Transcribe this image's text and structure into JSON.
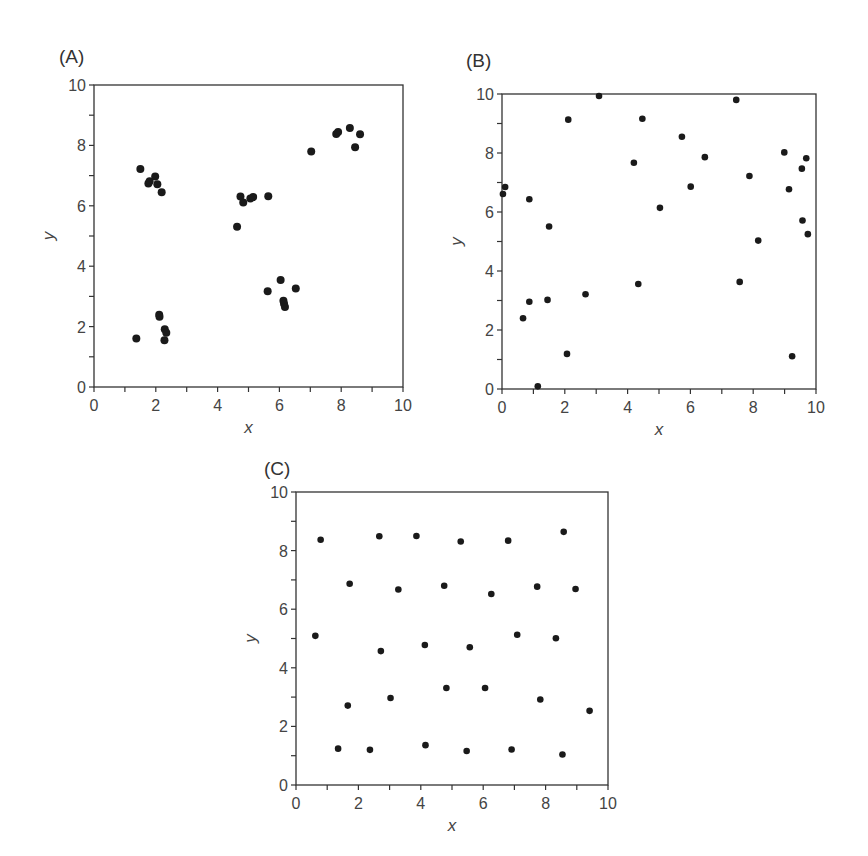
{
  "chart_data": [
    {
      "id": "A",
      "panel_label": "(A)",
      "type": "scatter",
      "title": "",
      "xlabel": "x",
      "ylabel": "y",
      "xlim": [
        0,
        10
      ],
      "ylim": [
        0,
        10
      ],
      "x_ticks": [
        0,
        2,
        4,
        6,
        8,
        10
      ],
      "y_ticks": [
        0,
        2,
        4,
        6,
        8,
        10
      ],
      "grid": false,
      "marker_color": "#1a1a1a",
      "points": [
        [
          1.5,
          7.22
        ],
        [
          1.76,
          6.74
        ],
        [
          1.8,
          6.81
        ],
        [
          1.98,
          6.97
        ],
        [
          2.05,
          6.71
        ],
        [
          2.19,
          6.45
        ],
        [
          1.37,
          1.61
        ],
        [
          2.11,
          2.39
        ],
        [
          2.12,
          2.33
        ],
        [
          2.29,
          1.91
        ],
        [
          2.34,
          1.8
        ],
        [
          2.28,
          1.55
        ],
        [
          4.63,
          5.31
        ],
        [
          4.74,
          6.31
        ],
        [
          4.83,
          6.11
        ],
        [
          5.06,
          6.24
        ],
        [
          5.15,
          6.29
        ],
        [
          5.64,
          6.32
        ],
        [
          5.62,
          3.17
        ],
        [
          6.04,
          3.54
        ],
        [
          6.53,
          3.26
        ],
        [
          6.13,
          2.86
        ],
        [
          6.15,
          2.76
        ],
        [
          6.18,
          2.65
        ],
        [
          7.03,
          7.8
        ],
        [
          7.84,
          8.38
        ],
        [
          7.9,
          8.44
        ],
        [
          8.28,
          8.58
        ],
        [
          8.61,
          8.37
        ],
        [
          8.45,
          7.94
        ]
      ]
    },
    {
      "id": "B",
      "panel_label": "(B)",
      "type": "scatter",
      "title": "",
      "xlabel": "x",
      "ylabel": "y",
      "xlim": [
        0,
        10
      ],
      "ylim": [
        0,
        10
      ],
      "x_ticks": [
        0,
        2,
        4,
        6,
        8,
        10
      ],
      "y_ticks": [
        0,
        2,
        4,
        6,
        8,
        10
      ],
      "grid": false,
      "marker_color": "#1a1a1a",
      "points": [
        [
          0.03,
          6.61
        ],
        [
          0.1,
          6.85
        ],
        [
          0.87,
          6.43
        ],
        [
          1.5,
          5.51
        ],
        [
          2.11,
          9.13
        ],
        [
          3.09,
          9.93
        ],
        [
          4.2,
          7.67
        ],
        [
          4.47,
          9.16
        ],
        [
          5.03,
          6.14
        ],
        [
          5.73,
          8.55
        ],
        [
          6.01,
          6.86
        ],
        [
          6.46,
          7.86
        ],
        [
          7.46,
          9.8
        ],
        [
          7.88,
          7.22
        ],
        [
          8.16,
          5.03
        ],
        [
          7.57,
          3.63
        ],
        [
          8.99,
          8.02
        ],
        [
          9.14,
          6.77
        ],
        [
          9.55,
          7.47
        ],
        [
          9.69,
          7.82
        ],
        [
          9.57,
          5.71
        ],
        [
          9.74,
          5.25
        ],
        [
          9.24,
          1.11
        ],
        [
          0.67,
          2.4
        ],
        [
          0.87,
          2.96
        ],
        [
          1.45,
          3.02
        ],
        [
          2.66,
          3.21
        ],
        [
          4.34,
          3.56
        ],
        [
          2.07,
          1.19
        ],
        [
          1.14,
          0.09
        ]
      ]
    },
    {
      "id": "C",
      "panel_label": "(C)",
      "type": "scatter",
      "title": "",
      "xlabel": "x",
      "ylabel": "y",
      "xlim": [
        0,
        10
      ],
      "ylim": [
        0,
        10
      ],
      "x_ticks": [
        0,
        2,
        4,
        6,
        8,
        10
      ],
      "y_ticks": [
        0,
        2,
        4,
        6,
        8,
        10
      ],
      "grid": false,
      "marker_color": "#1a1a1a",
      "points": [
        [
          0.79,
          8.37
        ],
        [
          2.67,
          8.49
        ],
        [
          3.86,
          8.5
        ],
        [
          5.28,
          8.31
        ],
        [
          6.8,
          8.34
        ],
        [
          8.58,
          8.64
        ],
        [
          1.72,
          6.87
        ],
        [
          3.28,
          6.67
        ],
        [
          4.75,
          6.8
        ],
        [
          6.26,
          6.52
        ],
        [
          7.73,
          6.77
        ],
        [
          8.96,
          6.69
        ],
        [
          0.62,
          5.09
        ],
        [
          2.72,
          4.57
        ],
        [
          4.13,
          4.78
        ],
        [
          5.57,
          4.7
        ],
        [
          7.09,
          5.13
        ],
        [
          8.33,
          5.01
        ],
        [
          1.66,
          2.71
        ],
        [
          3.03,
          2.97
        ],
        [
          4.82,
          3.31
        ],
        [
          6.06,
          3.31
        ],
        [
          7.83,
          2.92
        ],
        [
          9.41,
          2.53
        ],
        [
          1.35,
          1.24
        ],
        [
          2.37,
          1.2
        ],
        [
          4.15,
          1.36
        ],
        [
          5.47,
          1.16
        ],
        [
          6.91,
          1.21
        ],
        [
          8.54,
          1.04
        ]
      ]
    }
  ]
}
